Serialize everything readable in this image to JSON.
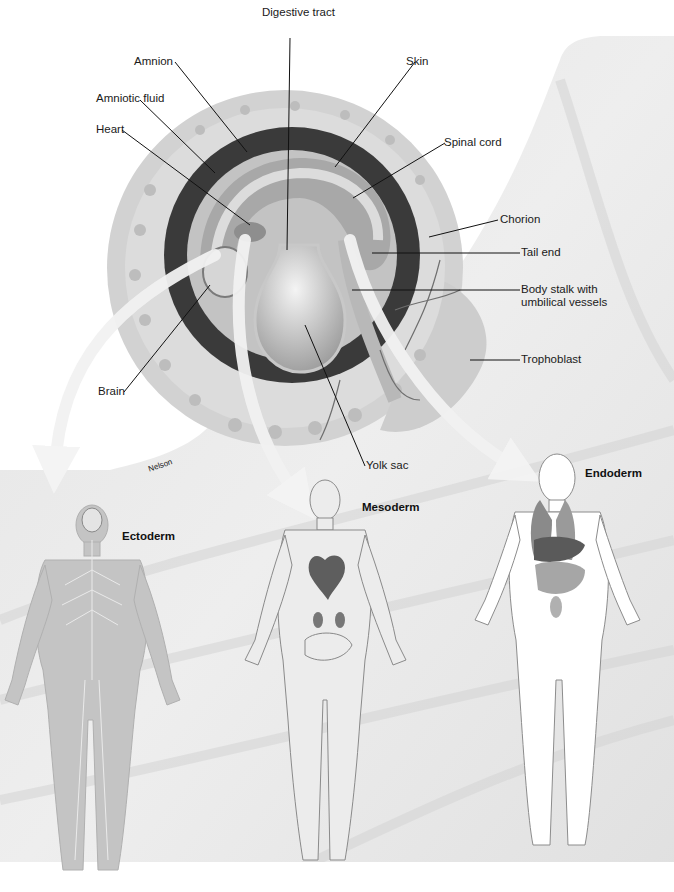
{
  "figure": {
    "colors": {
      "background": "#ffffff",
      "uterine_wall": "#e6e6e6",
      "chorion": "#cfcfcf",
      "amniotic_cavity_dark": "#3a3a3a",
      "embryo_light": "#c9c9c9",
      "arrow": "#f2f2f2",
      "label_text": "#1a1a1a",
      "leader_line": "#111111"
    }
  },
  "embryo_labels": {
    "digestive_tract": "Digestive tract",
    "amnion": "Amnion",
    "amniotic_fluid": "Amniotic fluid",
    "heart": "Heart",
    "skin": "Skin",
    "spinal_cord": "Spinal cord",
    "chorion": "Chorion",
    "tail_end": "Tail end",
    "body_stalk_line1": "Body stalk with",
    "body_stalk_line2": "umbilical vessels",
    "trophoblast": "Trophoblast",
    "brain": "Brain",
    "yolk_sac": "Yolk sac"
  },
  "germ_layers": [
    {
      "name": "Ectoderm",
      "system": "nervous system"
    },
    {
      "name": "Mesoderm",
      "system": "skeletal, muscular, circulatory, urinary"
    },
    {
      "name": "Endoderm",
      "system": "respiratory and digestive organs"
    }
  ],
  "signature": "Nelson"
}
